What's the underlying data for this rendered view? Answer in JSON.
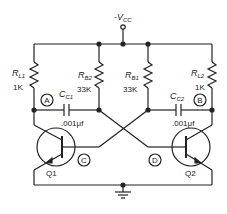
{
  "supply": {
    "label": "-V",
    "sub": "CC"
  },
  "resistors": [
    {
      "id": "RL1",
      "name": "R",
      "sub": "L1",
      "value": "1K"
    },
    {
      "id": "RB2",
      "name": "R",
      "sub": "B2",
      "value": "33K"
    },
    {
      "id": "RB1",
      "name": "R",
      "sub": "B1",
      "value": "33K"
    },
    {
      "id": "RL2",
      "name": "R",
      "sub": "L2",
      "value": "1K"
    }
  ],
  "capacitors": [
    {
      "id": "CC1",
      "name": "C",
      "sub": "C1",
      "value": ".001μf"
    },
    {
      "id": "CC2",
      "name": "C",
      "sub": "C2",
      "value": ".001μf"
    }
  ],
  "nodes": [
    "A",
    "B",
    "C",
    "D"
  ],
  "transistors": [
    {
      "label": "Q1"
    },
    {
      "label": "Q2"
    }
  ]
}
